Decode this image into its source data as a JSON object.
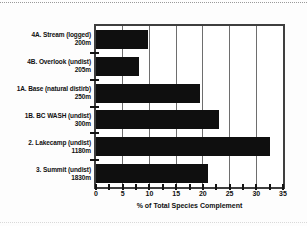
{
  "dividers": {
    "top_style": "dotted",
    "bottom_style": "dotted"
  },
  "chart_data": {
    "type": "bar",
    "orientation": "horizontal",
    "title": "",
    "xlabel": "% of Total Species Complement",
    "ylabel": "",
    "xlim": [
      0,
      35
    ],
    "xticks": [
      0,
      5,
      10,
      15,
      20,
      25,
      30,
      35
    ],
    "minor_tick_step": 2.5,
    "grid": "vertical",
    "legend": "none",
    "categories": [
      {
        "label": "4A. Stream (logged)",
        "elevation": "200m"
      },
      {
        "label": "4B. Overlook (undist)",
        "elevation": "205m"
      },
      {
        "label": "1A. Base (natural distirb)",
        "elevation": "250m"
      },
      {
        "label": "1B. BC WASH (undist)",
        "elevation": "300m"
      },
      {
        "label": "2. Lakecamp (undist)",
        "elevation": "1180m"
      },
      {
        "label": "3. Summit (undist)",
        "elevation": "1830m"
      }
    ],
    "values": [
      9.7,
      8.0,
      19.5,
      23.0,
      32.5,
      21.0
    ],
    "colors": {
      "bar": "#0f0f0f",
      "gridline": "#6e6e6e",
      "frame": "#3f3f3f",
      "text": "#101010",
      "plot_background": "#ffffff"
    }
  }
}
